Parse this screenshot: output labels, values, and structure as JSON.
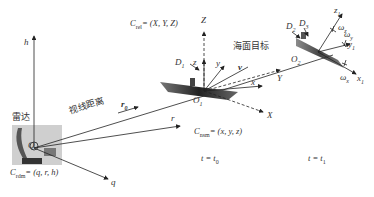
{
  "diagram": {
    "labels": {
      "radar": "雷达",
      "sight_distance": "视线距离",
      "sea_target": "海面目标",
      "c_rdm": "C",
      "c_rdm_sub": "rdm",
      "c_rdm_eq": "= (q, r, h)",
      "c_rel": "C",
      "c_rel_sub": "rel",
      "c_rel_eq": "= (X, Y, Z)",
      "c_nsm": "C",
      "c_nsm_sub": "nsm",
      "c_nsm_eq": "= (x, y, z)",
      "t0": "t = t",
      "t0_sub": "0",
      "t1": "t = t",
      "t1_sub": "1"
    },
    "axes": {
      "h": "h",
      "q": "q",
      "r": "r",
      "r0": "r",
      "r0_sub": "0",
      "Z": "Z",
      "Y": "Y",
      "X": "X",
      "z": "z",
      "y": "y",
      "x": "x",
      "v": "v",
      "O1": "O",
      "O1_sub": "1",
      "O2": "O",
      "O2_sub": "2",
      "Q": "Q",
      "D1": "D",
      "D1_sub": "1",
      "D2": "D",
      "D2_sub": "2",
      "D3": "D",
      "D3_sub": "3",
      "z1": "z",
      "z1_sub": "1",
      "y1": "y",
      "y1_sub": "1",
      "x1": "x",
      "x1_sub": "1",
      "w_z": "ω",
      "w_z_sub": "z",
      "w_y": "ω",
      "w_y_sub": "y",
      "w_x": "ω",
      "w_x_sub": "x"
    }
  }
}
